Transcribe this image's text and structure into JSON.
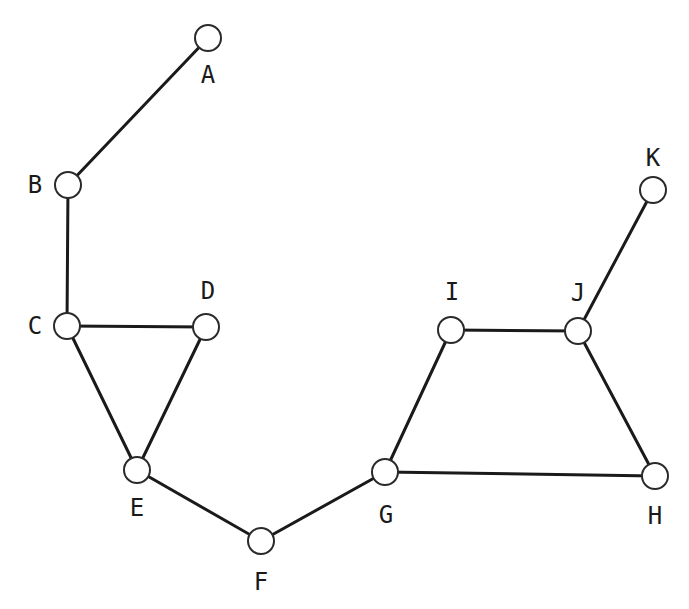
{
  "diagram": {
    "type": "undirected-graph",
    "nodes": [
      {
        "id": "A",
        "label": "A",
        "x": 208,
        "y": 38,
        "lx": 208,
        "ly": 75
      },
      {
        "id": "B",
        "label": "B",
        "x": 68,
        "y": 185,
        "lx": 35,
        "ly": 185
      },
      {
        "id": "C",
        "label": "C",
        "x": 67,
        "y": 326,
        "lx": 35,
        "ly": 326
      },
      {
        "id": "D",
        "label": "D",
        "x": 206,
        "y": 327,
        "lx": 208,
        "ly": 291
      },
      {
        "id": "E",
        "label": "E",
        "x": 137,
        "y": 470,
        "lx": 137,
        "ly": 508
      },
      {
        "id": "F",
        "label": "F",
        "x": 261,
        "y": 541,
        "lx": 261,
        "ly": 582
      },
      {
        "id": "G",
        "label": "G",
        "x": 385,
        "y": 472,
        "lx": 386,
        "ly": 515
      },
      {
        "id": "H",
        "label": "H",
        "x": 655,
        "y": 476,
        "lx": 655,
        "ly": 516
      },
      {
        "id": "I",
        "label": "I",
        "x": 451,
        "y": 330,
        "lx": 452,
        "ly": 292
      },
      {
        "id": "J",
        "label": "J",
        "x": 578,
        "y": 331,
        "lx": 578,
        "ly": 293
      },
      {
        "id": "K",
        "label": "K",
        "x": 653,
        "y": 190,
        "lx": 653,
        "ly": 158
      }
    ],
    "edges": [
      [
        "A",
        "B"
      ],
      [
        "B",
        "C"
      ],
      [
        "C",
        "D"
      ],
      [
        "C",
        "E"
      ],
      [
        "D",
        "E"
      ],
      [
        "E",
        "F"
      ],
      [
        "F",
        "G"
      ],
      [
        "G",
        "I"
      ],
      [
        "G",
        "H"
      ],
      [
        "I",
        "J"
      ],
      [
        "J",
        "H"
      ],
      [
        "J",
        "K"
      ]
    ],
    "node_radius": 13
  }
}
